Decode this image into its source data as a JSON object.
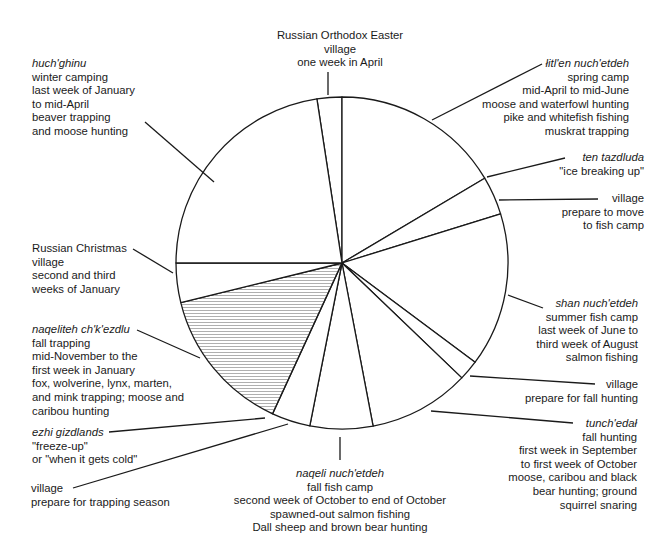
{
  "diagram": {
    "type": "seasonal-round-pie",
    "center": [
      342,
      263
    ],
    "radius": 166,
    "colors": {
      "stroke": "#1a1a1a",
      "hatch": "#9a9a9a",
      "background": "#ffffff"
    },
    "sectors": [
      {
        "id": "easter",
        "start": 351.3,
        "end": 360,
        "hatched": false
      },
      {
        "id": "spring-camp",
        "start": 0,
        "end": 59.3,
        "hatched": false
      },
      {
        "id": "ice-breaking",
        "start": 59.3,
        "end": 72.8,
        "hatched": false
      },
      {
        "id": "summer-fish-camp",
        "start": 72.8,
        "end": 126.7,
        "hatched": false
      },
      {
        "id": "village-fall-hunting",
        "start": 126.7,
        "end": 133.8,
        "hatched": false
      },
      {
        "id": "fall-hunting",
        "start": 133.8,
        "end": 169.2,
        "hatched": false
      },
      {
        "id": "fall-fish-camp",
        "start": 169.2,
        "end": 191.2,
        "hatched": false
      },
      {
        "id": "village-trapping",
        "start": 191.2,
        "end": 204.7,
        "hatched": false
      },
      {
        "id": "fall-trapping",
        "start": 204.7,
        "end": 256.2,
        "hatched": true
      },
      {
        "id": "russian-christmas",
        "start": 256.2,
        "end": 270,
        "hatched": false
      },
      {
        "id": "winter-camping",
        "start": 270,
        "end": 351.3,
        "hatched": false
      }
    ]
  },
  "labels": {
    "easter": {
      "lines": [
        "Russian Orthodox Easter",
        "village",
        "one week in April"
      ]
    },
    "spring": {
      "name": "łitl'en nuch'etdeh",
      "lines": [
        "spring camp",
        "mid-April to mid-June",
        "moose and waterfowl hunting",
        "pike and whitefish fishing",
        "muskrat trapping"
      ]
    },
    "ice": {
      "name": "ten tazdluda",
      "lines": [
        "\"ice breaking up\""
      ]
    },
    "village_fish": {
      "lines": [
        "village",
        "prepare to move",
        "to fish camp"
      ]
    },
    "summer": {
      "name": "shan nuch'etdeh",
      "lines": [
        "summer fish camp",
        "last week of June to",
        "third week of August",
        "salmon fishing"
      ]
    },
    "village_hunt": {
      "lines": [
        "village",
        "prepare for fall hunting"
      ]
    },
    "fall_hunt": {
      "name": "tunch'edał",
      "lines": [
        "fall hunting",
        "first week in September",
        "to first week of October",
        "moose, caribou and black",
        "bear hunting; ground",
        "squirrel snaring"
      ]
    },
    "fall_fish": {
      "name": "naqeli nuch'etdeh",
      "lines": [
        "fall fish camp",
        "second week of October to end of October",
        "spawned-out salmon fishing",
        "Dall sheep and brown bear hunting"
      ]
    },
    "village_trap": {
      "lines": [
        "village",
        "prepare for trapping season"
      ]
    },
    "freeze": {
      "name": "ezhi gizdlands",
      "lines": [
        "\"freeze-up\"",
        "or \"when it gets cold\""
      ]
    },
    "fall_trap": {
      "name": "naqeliteh ch'k'ezdlu",
      "lines": [
        "fall trapping",
        "mid-November to the",
        "first week in January",
        "fox, wolverine, lynx, marten,",
        "and mink trapping; moose and",
        "caribou hunting"
      ]
    },
    "christmas": {
      "lines": [
        "Russian Christmas",
        "village",
        "second and third",
        "weeks of January"
      ]
    },
    "winter": {
      "name": "huch'ghinu",
      "lines": [
        "winter camping",
        "last week of January",
        "to mid-April",
        "beaver trapping",
        "and moose hunting"
      ]
    }
  }
}
